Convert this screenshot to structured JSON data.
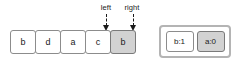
{
  "diagram": {
    "type": "sliding-window-array-diagram",
    "colors": {
      "cell_border": "#8c8c8c",
      "cell_fill": "#ffffff",
      "cell_highlight_fill": "#d2d2d2",
      "panel_border": "#b4b4b4",
      "text": "#1a1a1a",
      "arrow": "#1a1a1a"
    },
    "array": {
      "cells": [
        {
          "value": "b",
          "highlighted": false
        },
        {
          "value": "d",
          "highlighted": false
        },
        {
          "value": "a",
          "highlighted": false
        },
        {
          "value": "c",
          "highlighted": false
        },
        {
          "value": "b",
          "highlighted": true
        }
      ]
    },
    "pointers": [
      {
        "label": "left",
        "target_index": 3
      },
      {
        "label": "right",
        "target_index": 4
      }
    ],
    "counts_panel": {
      "entries": [
        {
          "label": "b:1",
          "highlighted": false
        },
        {
          "label": "a:0",
          "highlighted": true
        }
      ]
    }
  }
}
